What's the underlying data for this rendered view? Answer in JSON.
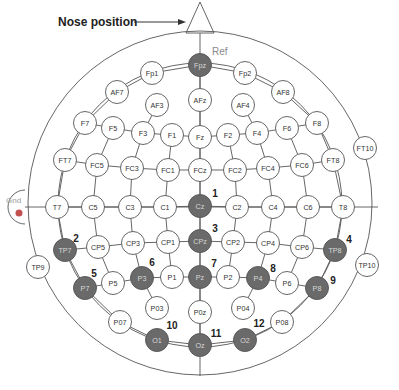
{
  "labels": {
    "nose": "Nose position",
    "ref": "Ref",
    "gnd": "Gnd"
  },
  "colors": {
    "active_fill": "#6a6a6a",
    "active_text": "#d8d8d8",
    "inactive_fill": "#ffffff",
    "inactive_text": "#333333",
    "stroke": "#555555",
    "gnd_dot": "#c45050"
  },
  "electrodes": [
    {
      "id": "Fp1",
      "x": 152,
      "y": 73,
      "active": false
    },
    {
      "id": "Fpz",
      "x": 200,
      "y": 65,
      "active": true
    },
    {
      "id": "Fp2",
      "x": 245,
      "y": 73,
      "active": false
    },
    {
      "id": "AF7",
      "x": 117,
      "y": 92,
      "active": false
    },
    {
      "id": "AFz",
      "x": 200,
      "y": 100,
      "active": false
    },
    {
      "id": "AF8",
      "x": 283,
      "y": 92,
      "active": false
    },
    {
      "id": "AF3",
      "x": 157,
      "y": 105,
      "active": false
    },
    {
      "id": "AF4",
      "x": 243,
      "y": 105,
      "active": false
    },
    {
      "id": "F7",
      "x": 85,
      "y": 123,
      "active": false
    },
    {
      "id": "F5",
      "x": 113,
      "y": 128,
      "active": false
    },
    {
      "id": "F3",
      "x": 143,
      "y": 133,
      "active": false
    },
    {
      "id": "F1",
      "x": 172,
      "y": 135,
      "active": false
    },
    {
      "id": "Fz",
      "x": 200,
      "y": 137,
      "active": false
    },
    {
      "id": "F2",
      "x": 228,
      "y": 135,
      "active": false
    },
    {
      "id": "F4",
      "x": 257,
      "y": 133,
      "active": false
    },
    {
      "id": "F6",
      "x": 287,
      "y": 128,
      "active": false
    },
    {
      "id": "F8",
      "x": 317,
      "y": 123,
      "active": false
    },
    {
      "id": "FT7",
      "x": 65,
      "y": 160,
      "active": false
    },
    {
      "id": "FC5",
      "x": 97,
      "y": 165,
      "active": false
    },
    {
      "id": "FC3",
      "x": 132,
      "y": 168,
      "active": false
    },
    {
      "id": "FC1",
      "x": 168,
      "y": 170,
      "active": false
    },
    {
      "id": "FCz",
      "x": 200,
      "y": 170,
      "active": false
    },
    {
      "id": "FC2",
      "x": 235,
      "y": 170,
      "active": false
    },
    {
      "id": "FC4",
      "x": 268,
      "y": 168,
      "active": false
    },
    {
      "id": "FC6",
      "x": 302,
      "y": 165,
      "active": false
    },
    {
      "id": "FT8",
      "x": 333,
      "y": 160,
      "active": false
    },
    {
      "id": "FT10",
      "x": 365,
      "y": 148,
      "active": false
    },
    {
      "id": "T7",
      "x": 57,
      "y": 207,
      "active": false
    },
    {
      "id": "C5",
      "x": 93,
      "y": 207,
      "active": false
    },
    {
      "id": "C3",
      "x": 130,
      "y": 207,
      "active": false
    },
    {
      "id": "C1",
      "x": 165,
      "y": 207,
      "active": false
    },
    {
      "id": "Cz",
      "x": 200,
      "y": 206,
      "active": true
    },
    {
      "id": "C2",
      "x": 237,
      "y": 207,
      "active": false
    },
    {
      "id": "C4",
      "x": 273,
      "y": 207,
      "active": false
    },
    {
      "id": "C6",
      "x": 308,
      "y": 207,
      "active": false
    },
    {
      "id": "T8",
      "x": 343,
      "y": 207,
      "active": false
    },
    {
      "id": "TP7",
      "x": 65,
      "y": 250,
      "active": true
    },
    {
      "id": "CP5",
      "x": 98,
      "y": 247,
      "active": false
    },
    {
      "id": "CP3",
      "x": 133,
      "y": 243,
      "active": false
    },
    {
      "id": "CP1",
      "x": 168,
      "y": 242,
      "active": false
    },
    {
      "id": "CPz",
      "x": 200,
      "y": 241,
      "active": true
    },
    {
      "id": "CP2",
      "x": 233,
      "y": 242,
      "active": false
    },
    {
      "id": "CP4",
      "x": 268,
      "y": 243,
      "active": false
    },
    {
      "id": "CP6",
      "x": 302,
      "y": 247,
      "active": false
    },
    {
      "id": "TP8",
      "x": 335,
      "y": 250,
      "active": true
    },
    {
      "id": "TP9",
      "x": 38,
      "y": 267,
      "active": false
    },
    {
      "id": "TP10",
      "x": 367,
      "y": 265,
      "active": false
    },
    {
      "id": "P7",
      "x": 85,
      "y": 288,
      "active": true
    },
    {
      "id": "P5",
      "x": 113,
      "y": 283,
      "active": false
    },
    {
      "id": "P3",
      "x": 142,
      "y": 278,
      "active": true
    },
    {
      "id": "P1",
      "x": 172,
      "y": 277,
      "active": false
    },
    {
      "id": "Pz",
      "x": 200,
      "y": 277,
      "active": true
    },
    {
      "id": "P2",
      "x": 228,
      "y": 277,
      "active": false
    },
    {
      "id": "P4",
      "x": 258,
      "y": 278,
      "active": true
    },
    {
      "id": "P6",
      "x": 287,
      "y": 283,
      "active": false
    },
    {
      "id": "P8",
      "x": 317,
      "y": 288,
      "active": true
    },
    {
      "id": "P03",
      "x": 157,
      "y": 308,
      "active": false
    },
    {
      "id": "P0z",
      "x": 200,
      "y": 312,
      "active": false
    },
    {
      "id": "P04",
      "x": 243,
      "y": 308,
      "active": false
    },
    {
      "id": "P07",
      "x": 120,
      "y": 322,
      "active": false
    },
    {
      "id": "P08",
      "x": 282,
      "y": 322,
      "active": false
    },
    {
      "id": "O1",
      "x": 157,
      "y": 340,
      "active": true
    },
    {
      "id": "Oz",
      "x": 200,
      "y": 345,
      "active": true
    },
    {
      "id": "O2",
      "x": 245,
      "y": 340,
      "active": true
    }
  ],
  "numbers": [
    {
      "n": "1",
      "x": 215,
      "y": 193
    },
    {
      "n": "2",
      "x": 76,
      "y": 238
    },
    {
      "n": "3",
      "x": 215,
      "y": 228
    },
    {
      "n": "4",
      "x": 349,
      "y": 239
    },
    {
      "n": "5",
      "x": 94,
      "y": 273
    },
    {
      "n": "6",
      "x": 152,
      "y": 262
    },
    {
      "n": "7",
      "x": 214,
      "y": 263
    },
    {
      "n": "8",
      "x": 273,
      "y": 268
    },
    {
      "n": "9",
      "x": 333,
      "y": 280
    },
    {
      "n": "10",
      "x": 172,
      "y": 325
    },
    {
      "n": "11",
      "x": 216,
      "y": 333
    },
    {
      "n": "12",
      "x": 259,
      "y": 323
    }
  ],
  "grid_rows": [
    [
      "Fp1",
      "Fpz",
      "Fp2"
    ],
    [
      "AF7",
      "Fp1"
    ],
    [
      "AF8",
      "Fp2"
    ],
    [
      "F7",
      "F5",
      "F3",
      "F1",
      "Fz",
      "F2",
      "F4",
      "F6",
      "F8"
    ],
    [
      "FT7",
      "FC5",
      "FC3",
      "FC1",
      "FCz",
      "FC2",
      "FC4",
      "FC6",
      "FT8"
    ],
    [
      "T7",
      "C5",
      "C3",
      "C1",
      "Cz",
      "C2",
      "C4",
      "C6",
      "T8"
    ],
    [
      "TP7",
      "CP5",
      "CP3",
      "CP1",
      "CPz",
      "CP2",
      "CP4",
      "CP6",
      "TP8"
    ],
    [
      "P7",
      "P5",
      "P3",
      "P1",
      "Pz",
      "P2",
      "P4",
      "P6",
      "P8"
    ],
    [
      "P07",
      "O1",
      "Oz",
      "O2",
      "P08"
    ]
  ],
  "grid_cols": [
    [
      "Fpz",
      "AFz",
      "Fz",
      "FCz",
      "Cz",
      "CPz",
      "Pz",
      "P0z",
      "Oz"
    ],
    [
      "AF3",
      "F3",
      "FC3",
      "C3",
      "CP3",
      "P3",
      "P03"
    ],
    [
      "AF4",
      "F4",
      "FC4",
      "C4",
      "CP4",
      "P4",
      "P04"
    ],
    [
      "F1",
      "FC1",
      "C1",
      "CP1",
      "P1"
    ],
    [
      "F2",
      "FC2",
      "C2",
      "CP2",
      "P2"
    ],
    [
      "F5",
      "FC5",
      "C5",
      "CP5",
      "P5"
    ],
    [
      "F6",
      "FC6",
      "C6",
      "CP6",
      "P6"
    ],
    [
      "AF7",
      "F7",
      "FT7",
      "T7",
      "TP7",
      "P7",
      "P07"
    ],
    [
      "AF8",
      "F8",
      "FT8",
      "T8",
      "TP8",
      "P8",
      "P08"
    ]
  ]
}
